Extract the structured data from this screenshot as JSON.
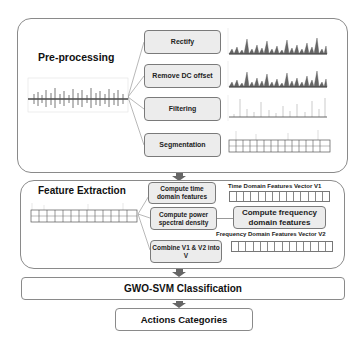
{
  "preprocessing": {
    "title": "Pre-processing",
    "steps": [
      {
        "label": "Rectify"
      },
      {
        "label": "Remove DC offset"
      },
      {
        "label": "Filtering"
      },
      {
        "label": "Segmentation"
      }
    ]
  },
  "feature_extraction": {
    "title": "Feature Extraction",
    "steps": [
      {
        "label": "Compute time domain features"
      },
      {
        "label": "Compute power spectral density"
      },
      {
        "label": "Compute frequency domain features"
      },
      {
        "label": "Combine V1 & V2 into V"
      }
    ],
    "vectors": [
      {
        "label": "Time Domain Features Vector V1",
        "cells": 14
      },
      {
        "label": "Frequency Domain Features Vector V2",
        "cells": 14
      }
    ]
  },
  "classification": {
    "title": "GWO-SVM Classification"
  },
  "output": {
    "title": "Actions Categories"
  },
  "colors": {
    "step_fill": "#ececec",
    "border": "#8a8a8a",
    "arrow": "#666666",
    "signal": "#555555"
  }
}
